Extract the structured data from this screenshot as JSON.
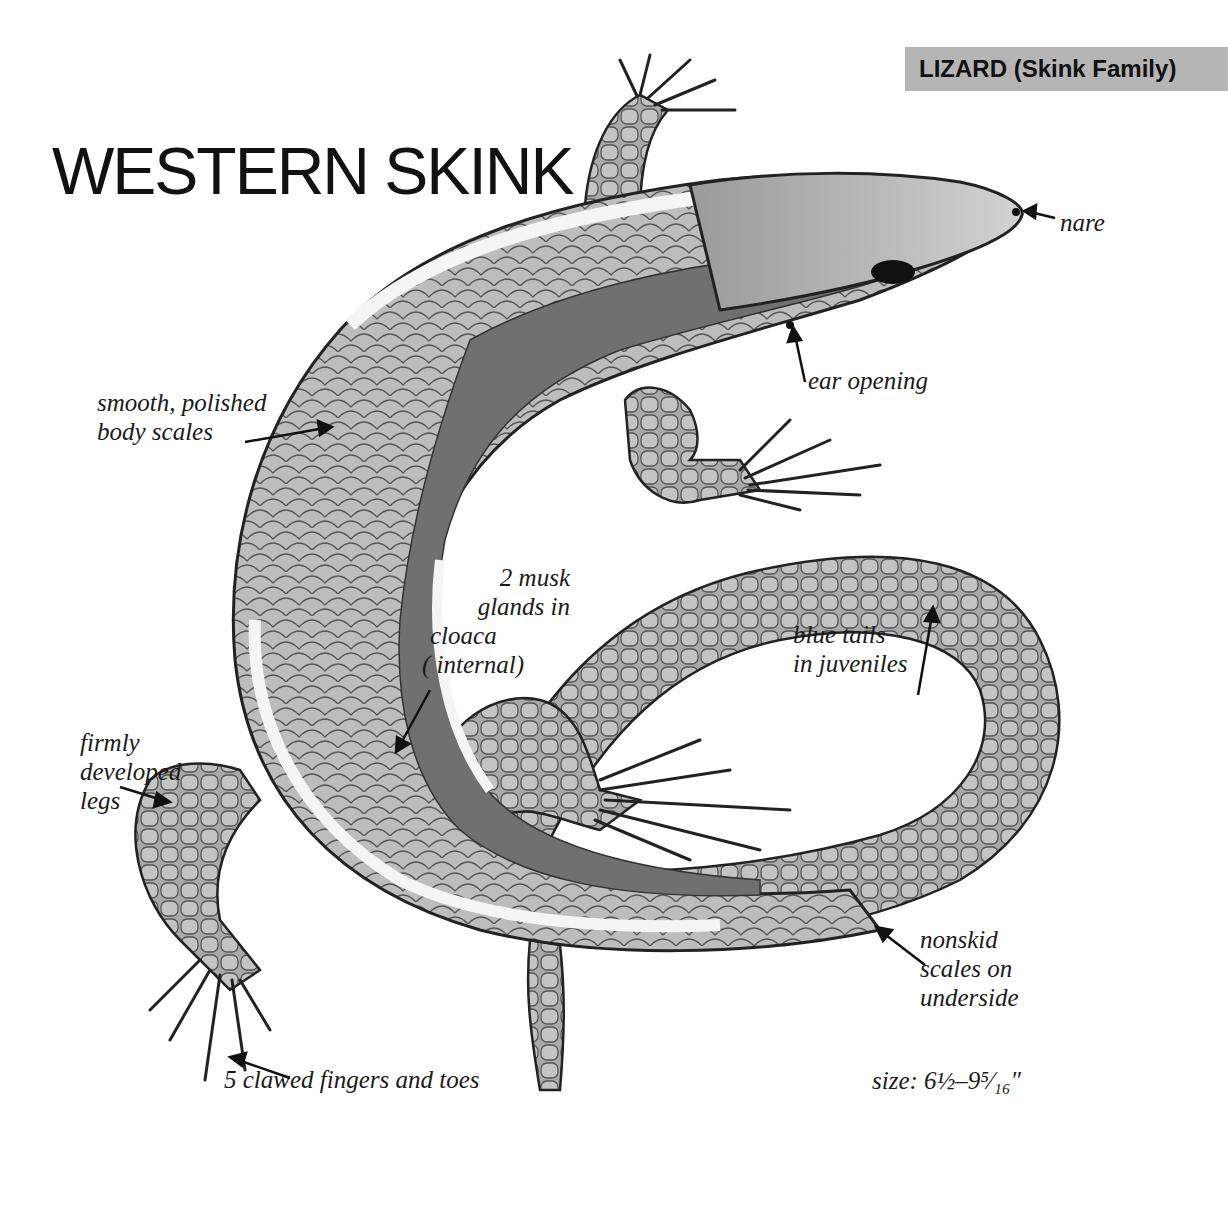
{
  "header": {
    "family_badge": "LIZARD (Skink Family)",
    "title": "WESTERN SKINK"
  },
  "colors": {
    "badge_bg": "#b5b5b5",
    "ink": "#111111",
    "scale_fill": "#b8b8b8",
    "stripe_dark": "#6e6e6e",
    "stripe_light": "#f4f4f4"
  },
  "labels": {
    "nare": "nare",
    "ear_opening": "ear opening",
    "body_scales_line1": "smooth, polished",
    "body_scales_line2": "body scales",
    "musk_line1": "2 musk",
    "musk_line2": "glands in",
    "musk_line3": "cloaca",
    "musk_line4": "( internal)",
    "blue_tails_line1": "blue tails",
    "blue_tails_line2": "in juveniles",
    "legs_line1": "firmly",
    "legs_line2": "developed",
    "legs_line3": "legs",
    "nonskid_line1": "nonskid",
    "nonskid_line2": "scales on",
    "nonskid_line3": "underside",
    "claws": "5 clawed fingers and toes",
    "size": "size:  6½–9⁵⁄₁₆″"
  },
  "illustration": {
    "subject": "western-skink-dorsal-view",
    "icon": "lizard-illustration"
  }
}
